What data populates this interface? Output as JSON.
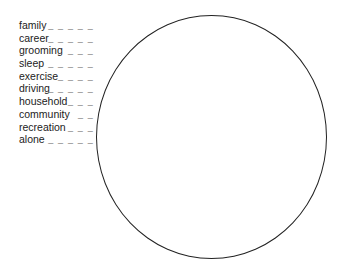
{
  "activities": [
    {
      "label": "family",
      "blank": "_ _ _ _ _"
    },
    {
      "label": "career",
      "blank": "_ _ _ _ _"
    },
    {
      "label": "grooming",
      "blank": "_ _ _"
    },
    {
      "label": "sleep",
      "blank": "_ _ _ _ _"
    },
    {
      "label": "exercise",
      "blank": "_ _ _ _"
    },
    {
      "label": "driving",
      "blank": "_ _ _ _ _"
    },
    {
      "label": "household",
      "blank": "_ _ _"
    },
    {
      "label": "community",
      "blank": "_ _"
    },
    {
      "label": "recreation",
      "blank": "_ _ _"
    },
    {
      "label": "alone",
      "blank": "_ _ _ _ _"
    }
  ],
  "circle": {
    "stroke_color": "#222222",
    "fill": "#ffffff"
  }
}
